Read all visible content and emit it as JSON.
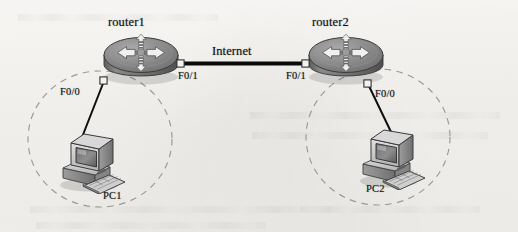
{
  "diagram": {
    "background_color": "#f6f5f2",
    "link_color": "#0d0d0d",
    "cloud_color": "#9a9a93",
    "device_body_color": "#8d8d8d"
  },
  "routers": [
    {
      "id": "router1",
      "label": "router1",
      "icon": "router-icon",
      "x": 140,
      "y": 58,
      "ports": [
        {
          "name": "F0/0",
          "label": "F0/0",
          "x": 62,
          "y": 88
        },
        {
          "name": "F0/1",
          "label": "F0/1",
          "x": 180,
          "y": 71
        }
      ]
    },
    {
      "id": "router2",
      "label": "router2",
      "icon": "router-icon",
      "x": 345,
      "y": 58,
      "ports": [
        {
          "name": "F0/1",
          "label": "F0/1",
          "x": 289,
          "y": 71
        },
        {
          "name": "F0/0",
          "label": "F0/0",
          "x": 375,
          "y": 89
        }
      ]
    }
  ],
  "links": [
    {
      "id": "wan-link",
      "label": "Internet",
      "from": "router1:F0/1",
      "to": "router2:F0/1",
      "style": "thick-solid"
    },
    {
      "id": "lan-link-1",
      "label": "",
      "from": "router1:F0/0",
      "to": "PC1",
      "style": "thin-solid"
    },
    {
      "id": "lan-link-2",
      "label": "",
      "from": "router2:F0/0",
      "to": "PC2",
      "style": "thin-solid"
    }
  ],
  "hosts": [
    {
      "id": "PC1",
      "label": "PC1",
      "icon": "desktop-computer-icon",
      "x": 100,
      "y": 160,
      "label_x": 100,
      "label_y": 196
    },
    {
      "id": "PC2",
      "label": "PC2",
      "icon": "desktop-computer-icon",
      "x": 394,
      "y": 160,
      "label_x": 372,
      "label_y": 190
    }
  ],
  "clouds": [
    {
      "id": "lan-cloud-1",
      "for": "PC1",
      "cx": 100,
      "cy": 139,
      "rx": 72,
      "ry": 68,
      "style": "dashed"
    },
    {
      "id": "lan-cloud-2",
      "for": "PC2",
      "cx": 378,
      "cy": 137,
      "rx": 72,
      "ry": 68,
      "style": "dashed"
    }
  ]
}
